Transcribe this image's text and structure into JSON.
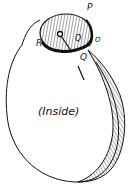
{
  "figure": {
    "labels": {
      "P": "P",
      "Q_upper": "Q",
      "Q_lower": "Q",
      "R": "R",
      "O": "O",
      "inside": "(Inside)"
    },
    "colors": {
      "ink": "#111111",
      "background": "#ffffff"
    }
  }
}
